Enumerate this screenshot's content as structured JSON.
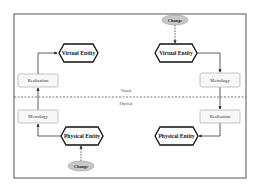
{
  "diagram": {
    "layers": {
      "top_label": "Virtual",
      "bottom_label": "Physical"
    },
    "left_flow": {
      "virtual_entity": "Virtual Entity",
      "realisation": "Realisation",
      "metrology": "Metrology",
      "physical_entity": "Physical Entity",
      "change": "Change"
    },
    "right_flow": {
      "change": "Change",
      "virtual_entity": "Virtual Entity",
      "metrology": "Metrology",
      "realisation": "Realisation",
      "physical_entity": "Physical Entity"
    },
    "colors": {
      "frame": "#555555",
      "hexagon_stroke": "#111111",
      "box_fill": "#f7f7f7",
      "change_fill": "#c8c8c8"
    }
  }
}
